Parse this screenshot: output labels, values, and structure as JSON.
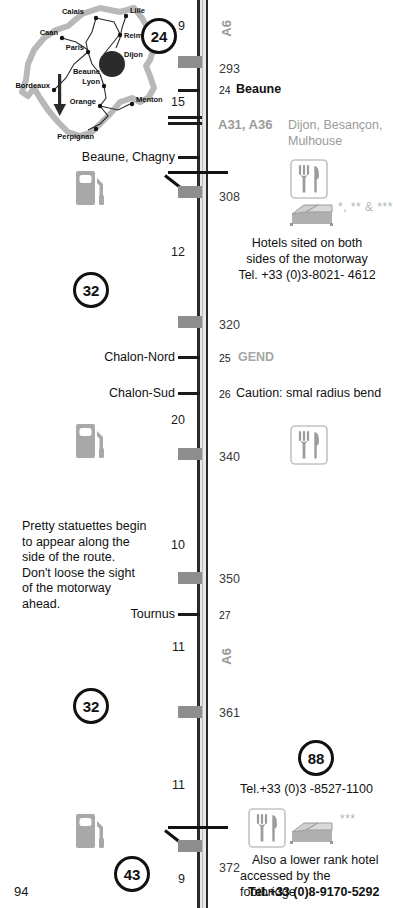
{
  "page": {
    "number": "94",
    "motorway": "A6"
  },
  "inset_map": {
    "name": "france-map",
    "highlight_city": "Dijon",
    "cities": [
      {
        "name": "Calais",
        "x": 78,
        "y": 14
      },
      {
        "name": "Lille",
        "x": 122,
        "y": 13
      },
      {
        "name": "Caan",
        "x": 46,
        "y": 36
      },
      {
        "name": "Reims",
        "x": 110,
        "y": 42
      },
      {
        "name": "Paris",
        "x": 74,
        "y": 52
      },
      {
        "name": "Dijon",
        "x": 113,
        "y": 59
      },
      {
        "name": "Beaune",
        "x": 88,
        "y": 70
      },
      {
        "name": "Bordeaux",
        "x": 20,
        "y": 92
      },
      {
        "name": "Lyon",
        "x": 95,
        "y": 85
      },
      {
        "name": "Orange",
        "x": 88,
        "y": 103
      },
      {
        "name": "Menton",
        "x": 131,
        "y": 102
      },
      {
        "name": "Perpignan",
        "x": 70,
        "y": 128
      }
    ]
  },
  "road": {
    "code_top": "A6",
    "code_mid": "A6",
    "junction": {
      "codes": "A31, A36",
      "destinations_line1": "Dijon, Besançon,",
      "destinations_line2": "Mulhouse"
    }
  },
  "distance_markers": [
    {
      "value": "9",
      "y": 19
    },
    {
      "value": "15",
      "y": 95
    },
    {
      "value": "12",
      "y": 245
    },
    {
      "value": "20",
      "y": 413
    },
    {
      "value": "10",
      "y": 538
    },
    {
      "value": "11",
      "y": 640
    },
    {
      "value": "11",
      "y": 778
    },
    {
      "value": "9",
      "y": 872
    }
  ],
  "km_markers": [
    {
      "value": "293",
      "y": 62
    },
    {
      "value": "308",
      "y": 190
    },
    {
      "value": "320",
      "y": 318
    },
    {
      "value": "340",
      "y": 450
    },
    {
      "value": "350",
      "y": 572
    },
    {
      "value": "361",
      "y": 706
    },
    {
      "value": "372",
      "y": 867
    }
  ],
  "exits": [
    {
      "number": "24",
      "name": "Beaune",
      "y": 84,
      "side": "right"
    },
    {
      "number": "25",
      "name": "Chalon-Nord",
      "y": 352,
      "side": "left"
    },
    {
      "number": "26",
      "name": "Chalon-Sud",
      "y": 388,
      "side": "left"
    },
    {
      "number": "27",
      "name": "Tournus",
      "y": 609,
      "side": "left"
    }
  ],
  "left_exit_labels": [
    {
      "label": "Beaune, Chagny",
      "y": 153
    },
    {
      "label": "Chalon-Nord",
      "y": 352
    },
    {
      "label": "Chalon-Sud",
      "y": 388
    },
    {
      "label": "Tournus",
      "y": 609
    }
  ],
  "circle_markers": [
    {
      "value": "24",
      "x": 141,
      "y": 18
    },
    {
      "value": "32",
      "x": 73,
      "y": 272
    },
    {
      "value": "32",
      "x": 73,
      "y": 688
    },
    {
      "value": "88",
      "x": 298,
      "y": 740
    },
    {
      "value": "43",
      "x": 114,
      "y": 856
    }
  ],
  "annotations": {
    "gend": "GEND",
    "caution": "Caution: smal radius bend",
    "statuettes_note": "Pretty statuettes begin\nto appear along the\nside of the route.\nDon't loose the sight\nof the motorway\nahead.",
    "hotel_note_line1": "Hotels sited on both",
    "hotel_note_line2": "sides of the motorway",
    "hotel_note_line3": "Tel. +33 (0)3-8021- 4612",
    "hotel_stars": "*, ** & ***",
    "service88_phone": "Tel.+33 (0)3 -8527-1100",
    "service88_stars": "***",
    "service88_note_line1": "Also a lower rank hotel",
    "service88_note_line2": "accessed by the footbridge",
    "service88_note_line3": "Tel.+33 (0)8-9170-5292"
  },
  "icons": {
    "fuel": "fuel-pump-icon",
    "restaurant": "fork-knife-icon",
    "hotel": "bed-icon"
  },
  "colors": {
    "road": "#2a2a2a",
    "service_block": "#8e8e8e",
    "muted_text": "#9a9a9a",
    "body_text": "#111111"
  }
}
